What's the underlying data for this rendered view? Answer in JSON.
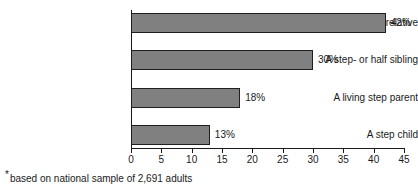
{
  "chart_data": {
    "type": "bar",
    "orientation": "horizontal",
    "title": "",
    "xlabel": "",
    "ylabel": "",
    "categories": [
      "At least one step-relative",
      "A step- or half sibling",
      "A living step parent",
      "A step child"
    ],
    "values": [
      42,
      30,
      18,
      13
    ],
    "value_labels": [
      "42%",
      "30%",
      "18%",
      "13%"
    ],
    "xlim": [
      0,
      45
    ],
    "xticks": [
      0,
      5,
      10,
      15,
      20,
      25,
      30,
      35,
      40,
      45
    ],
    "xtick_labels": [
      "0",
      "5",
      "10",
      "15",
      "20",
      "25",
      "30",
      "35",
      "40",
      "45"
    ],
    "grid": false,
    "legend": false,
    "bar_color": "#808080",
    "bar_border_color": "#1f1f1f",
    "text_color": "#1a1a1a",
    "background": "#ffffff"
  },
  "footnote": {
    "marker": "*",
    "text": "based on national sample of 2,691 adults"
  }
}
